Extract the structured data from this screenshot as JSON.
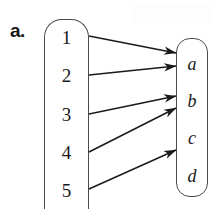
{
  "figure": {
    "part_label": "a.",
    "type": "mapping-diagram",
    "stroke_color": "#4a4a4a",
    "arrow_color": "#1a1a1a",
    "background": "#ffffff",
    "domain": {
      "name": "domain-set",
      "elements": [
        {
          "label": "1",
          "y": 37
        },
        {
          "label": "2",
          "y": 75
        },
        {
          "label": "3",
          "y": 114
        },
        {
          "label": "4",
          "y": 152
        },
        {
          "label": "5",
          "y": 190
        }
      ]
    },
    "codomain": {
      "name": "codomain-set",
      "elements": [
        {
          "label": "a",
          "y": 63
        },
        {
          "label": "b",
          "y": 100
        },
        {
          "label": "c",
          "y": 137
        },
        {
          "label": "d",
          "y": 175
        }
      ]
    },
    "arrows": [
      {
        "from": "1",
        "to": "a",
        "x1": 89,
        "y1": 36,
        "x2": 176,
        "y2": 53
      },
      {
        "from": "2",
        "to": "a",
        "x1": 89,
        "y1": 75,
        "x2": 176,
        "y2": 66
      },
      {
        "from": "3",
        "to": "b",
        "x1": 89,
        "y1": 114,
        "x2": 176,
        "y2": 96
      },
      {
        "from": "4",
        "to": "b",
        "x1": 89,
        "y1": 152,
        "x2": 176,
        "y2": 108
      },
      {
        "from": "5",
        "to": "c",
        "x1": 89,
        "y1": 189,
        "x2": 176,
        "y2": 150
      }
    ]
  }
}
